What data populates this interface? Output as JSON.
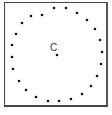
{
  "diagram": {
    "center_label": "C",
    "center_label_pos": {
      "x": 50,
      "y": 43
    },
    "center_point": {
      "x": 57,
      "y": 55
    },
    "point_color": "#111111",
    "frame_color": "#444444",
    "points": [
      {
        "x": 42,
        "y": 15
      },
      {
        "x": 54,
        "y": 8
      },
      {
        "x": 66,
        "y": 8
      },
      {
        "x": 77,
        "y": 13
      },
      {
        "x": 87,
        "y": 20
      },
      {
        "x": 95,
        "y": 29
      },
      {
        "x": 100,
        "y": 40
      },
      {
        "x": 102,
        "y": 52
      },
      {
        "x": 101,
        "y": 64
      },
      {
        "x": 97,
        "y": 76
      },
      {
        "x": 91,
        "y": 86
      },
      {
        "x": 82,
        "y": 94
      },
      {
        "x": 71,
        "y": 99
      },
      {
        "x": 59,
        "y": 101
      },
      {
        "x": 48,
        "y": 101
      },
      {
        "x": 36,
        "y": 97
      },
      {
        "x": 26,
        "y": 90
      },
      {
        "x": 19,
        "y": 81
      },
      {
        "x": 13,
        "y": 69
      },
      {
        "x": 12,
        "y": 57
      },
      {
        "x": 12,
        "y": 45
      },
      {
        "x": 16,
        "y": 34
      },
      {
        "x": 22,
        "y": 23
      },
      {
        "x": 31,
        "y": 16
      }
    ]
  }
}
